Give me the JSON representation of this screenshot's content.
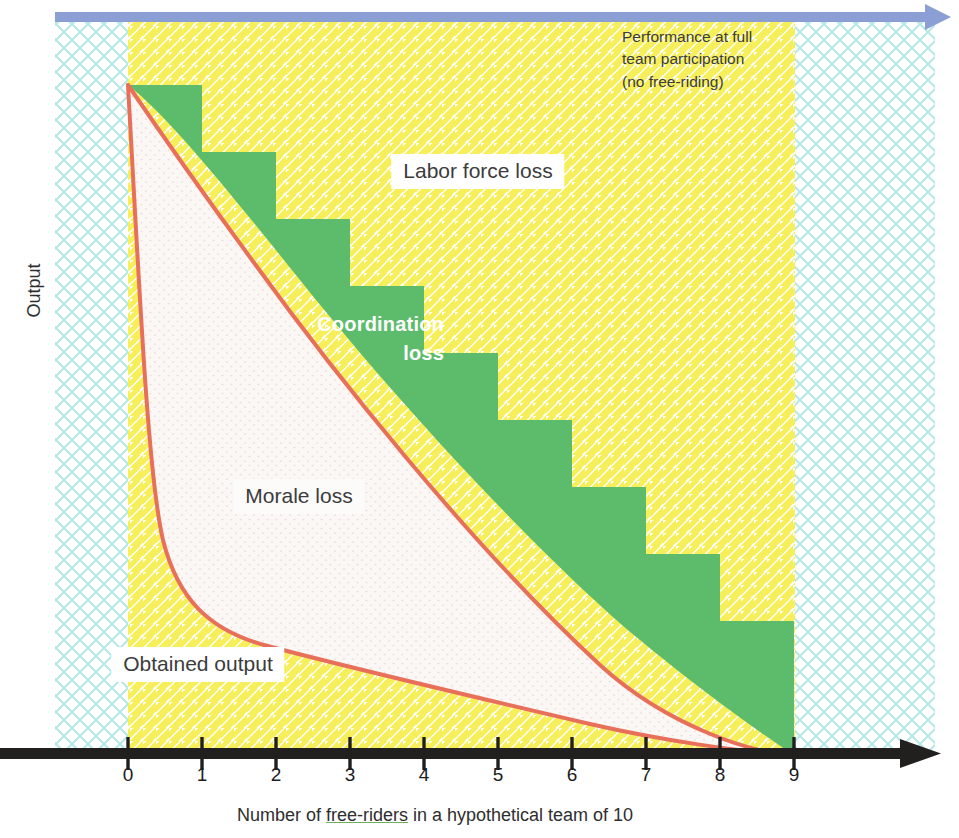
{
  "figure": {
    "y_axis_label": "Output",
    "x_axis_label_parts": {
      "pre": "Number of ",
      "underlined": "free-riders",
      "post": " in a hypothetical team of 10"
    },
    "x_axis_label_full": "Number of free-riders in a hypothetical team of 10",
    "top_arrow_note_line1": "Performance at full",
    "top_arrow_note_line2": "team participation",
    "top_arrow_note_line3": "(no free-riding)",
    "region_labels": {
      "labor_force_loss": "Labor force loss",
      "coordination_loss_line1": "Coordination",
      "coordination_loss_line2": "loss",
      "morale_loss": "Morale loss",
      "obtained_output": "Obtained output"
    }
  },
  "colors": {
    "curve_red": "#e8705a",
    "green_fill": "#5cbc6b",
    "yellow_hatch": "#f5ec52",
    "cyan_hatch": "#9fe0e0",
    "blue_arrow": "#8b9fd4",
    "axis_black": "#221f1f",
    "label_text": "#3c3c3c"
  },
  "chart_data": {
    "type": "area",
    "title": "",
    "xlabel": "Number of free-riders in a hypothetical team of 10",
    "ylabel": "Output",
    "xlim": [
      0,
      9
    ],
    "ylim": [
      0,
      100
    ],
    "grid": false,
    "legend_position": "in-plot annotations",
    "categories": [
      "0",
      "1",
      "2",
      "3",
      "4",
      "5",
      "6",
      "7",
      "8",
      "9"
    ],
    "x_tick_labels": [
      "0",
      "1",
      "2",
      "3",
      "4",
      "5",
      "6",
      "7",
      "8",
      "9"
    ],
    "y_tick_labels": [],
    "series": [
      {
        "name": "Performance at full team participation (no free-riding)",
        "type": "reference-line",
        "x": [
          0,
          9
        ],
        "values": [
          100,
          100
        ]
      },
      {
        "name": "Potential productivity (labor force available, step function)",
        "type": "step",
        "x": [
          0,
          1,
          2,
          3,
          4,
          5,
          6,
          7,
          8,
          9
        ],
        "values": [
          100,
          90,
          80,
          70,
          60,
          50,
          40,
          30,
          20,
          10
        ]
      },
      {
        "name": "Actual productivity after coordination loss",
        "type": "line",
        "x": [
          0,
          1,
          2,
          3,
          4,
          5,
          6,
          7,
          8,
          9
        ],
        "values": [
          100,
          76,
          62,
          52,
          44,
          36,
          29,
          21,
          12,
          0
        ]
      },
      {
        "name": "Obtained output (after morale loss)",
        "type": "line",
        "x": [
          0,
          0.3,
          0.7,
          1,
          1.5,
          2,
          3,
          4,
          5,
          6,
          7,
          8,
          9
        ],
        "values": [
          100,
          56,
          34,
          26,
          19,
          15,
          12,
          10.5,
          9,
          7.5,
          6,
          4,
          0
        ]
      }
    ],
    "annotations": [
      {
        "text": "Labor force loss",
        "region": "between full-participation line and step function"
      },
      {
        "text": "Coordination loss",
        "region": "between step function and actual productivity curve"
      },
      {
        "text": "Morale loss",
        "region": "between actual productivity curve and obtained output curve"
      },
      {
        "text": "Obtained output",
        "region": "area under the obtained output curve"
      }
    ]
  }
}
